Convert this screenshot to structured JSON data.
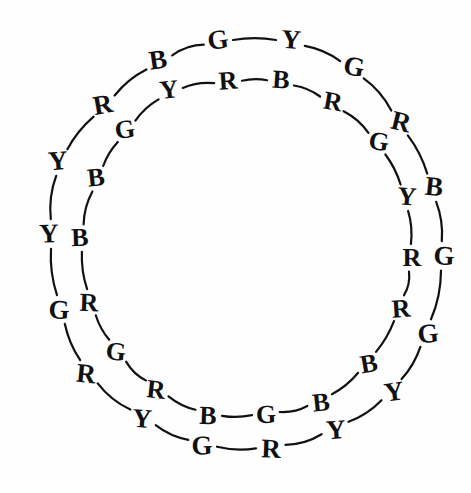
{
  "figure": {
    "background_color": "#fefefe",
    "ink_color": "#111111",
    "width": 471,
    "height": 493,
    "center": {
      "x": 240,
      "y": 243
    }
  },
  "legend": {
    "letters": [
      "R",
      "G",
      "B",
      "Y"
    ],
    "letter_names": {
      "R": "red",
      "G": "green",
      "B": "blue",
      "Y": "yellow"
    }
  },
  "chart_data": {
    "type": "scatter",
    "xlabel": "",
    "ylabel": "",
    "grid": false,
    "legend_position": "none",
    "xlim": [
      0,
      471
    ],
    "ylim": [
      0,
      493
    ],
    "series": [
      {
        "name": "outer-ring",
        "count": 18,
        "radius": 205,
        "labels": [
          "G",
          "Y",
          "G",
          "R",
          "B",
          "G",
          "G",
          "Y",
          "Y",
          "R",
          "G",
          "Y",
          "Y",
          "R",
          "B",
          "G",
          "B",
          "R"
        ],
        "points": [
          {
            "label": "G",
            "x": 218,
            "y": 40
          },
          {
            "label": "Y",
            "x": 291,
            "y": 40
          },
          {
            "label": "G",
            "x": 354,
            "y": 67
          },
          {
            "label": "R",
            "x": 401,
            "y": 122
          },
          {
            "label": "B",
            "x": 434,
            "y": 187
          },
          {
            "label": "G",
            "x": 444,
            "y": 256
          },
          {
            "label": "G",
            "x": 428,
            "y": 334
          },
          {
            "label": "Y",
            "x": 394,
            "y": 392
          },
          {
            "label": "Y",
            "x": 336,
            "y": 430
          },
          {
            "label": "R",
            "x": 271,
            "y": 449
          },
          {
            "label": "G",
            "x": 202,
            "y": 446
          },
          {
            "label": "Y",
            "x": 142,
            "y": 419
          },
          {
            "label": "Y",
            "x": 86,
            "y": 374
          },
          {
            "label": "R",
            "x": 59,
            "y": 310
          },
          {
            "label": "B",
            "x": 79,
            "y": 237
          },
          {
            "label": "G",
            "x": 49,
            "y": 234
          },
          {
            "label": "B",
            "x": 58,
            "y": 161
          },
          {
            "label": "R",
            "x": 103,
            "y": 105
          }
        ]
      },
      {
        "name": "inner-ring",
        "count": 18,
        "radius": 163,
        "labels": [
          "R",
          "B",
          "R",
          "G",
          "Y",
          "R",
          "R",
          "B",
          "B",
          "G",
          "B",
          "Y",
          "R",
          "G",
          "R",
          "B",
          "B",
          "G",
          "Y"
        ],
        "points": [
          {
            "label": "R",
            "x": 228,
            "y": 81
          },
          {
            "label": "B",
            "x": 281,
            "y": 80
          },
          {
            "label": "R",
            "x": 333,
            "y": 102
          },
          {
            "label": "G",
            "x": 379,
            "y": 142
          },
          {
            "label": "Y",
            "x": 407,
            "y": 197
          },
          {
            "label": "R",
            "x": 412,
            "y": 258
          },
          {
            "label": "R",
            "x": 401,
            "y": 309
          },
          {
            "label": "B",
            "x": 369,
            "y": 364
          },
          {
            "label": "B",
            "x": 321,
            "y": 403
          },
          {
            "label": "G",
            "x": 266,
            "y": 415
          },
          {
            "label": "B",
            "x": 208,
            "y": 416
          },
          {
            "label": "Y",
            "x": 156,
            "y": 390
          },
          {
            "label": "R",
            "x": 116,
            "y": 352
          },
          {
            "label": "G",
            "x": 89,
            "y": 303
          },
          {
            "label": "R",
            "x": 80,
            "y": 238
          },
          {
            "label": "B",
            "x": 96,
            "y": 178
          },
          {
            "label": "G",
            "x": 125,
            "y": 130
          },
          {
            "label": "Y",
            "x": 169,
            "y": 90
          }
        ]
      }
    ]
  },
  "outer_ring": {
    "name": "outer-ring",
    "letters": [
      {
        "char": "G",
        "x": 218,
        "y": 40,
        "rot": -8
      },
      {
        "char": "Y",
        "x": 291,
        "y": 40,
        "rot": 4
      },
      {
        "char": "G",
        "x": 354,
        "y": 67,
        "rot": 10
      },
      {
        "char": "R",
        "x": 401,
        "y": 122,
        "rot": 14
      },
      {
        "char": "B",
        "x": 434,
        "y": 187,
        "rot": 6
      },
      {
        "char": "G",
        "x": 444,
        "y": 256,
        "rot": 2
      },
      {
        "char": "G",
        "x": 428,
        "y": 334,
        "rot": -6
      },
      {
        "char": "Y",
        "x": 394,
        "y": 392,
        "rot": -8
      },
      {
        "char": "Y",
        "x": 336,
        "y": 430,
        "rot": -4
      },
      {
        "char": "R",
        "x": 271,
        "y": 449,
        "rot": 2
      },
      {
        "char": "G",
        "x": 202,
        "y": 446,
        "rot": -2
      },
      {
        "char": "Y",
        "x": 142,
        "y": 419,
        "rot": 4
      },
      {
        "char": "R",
        "x": 86,
        "y": 374,
        "rot": 6
      },
      {
        "char": "G",
        "x": 59,
        "y": 310,
        "rot": 2
      },
      {
        "char": "Y",
        "x": 49,
        "y": 234,
        "rot": -2
      },
      {
        "char": "Y",
        "x": 58,
        "y": 161,
        "rot": -4
      },
      {
        "char": "R",
        "x": 103,
        "y": 105,
        "rot": -10
      },
      {
        "char": "B",
        "x": 158,
        "y": 60,
        "rot": -8
      }
    ]
  },
  "inner_ring": {
    "name": "inner-ring",
    "letters": [
      {
        "char": "R",
        "x": 228,
        "y": 81,
        "rot": -4
      },
      {
        "char": "B",
        "x": 281,
        "y": 80,
        "rot": 4
      },
      {
        "char": "R",
        "x": 333,
        "y": 102,
        "rot": 10
      },
      {
        "char": "G",
        "x": 379,
        "y": 142,
        "rot": 8
      },
      {
        "char": "Y",
        "x": 407,
        "y": 197,
        "rot": 4
      },
      {
        "char": "R",
        "x": 412,
        "y": 258,
        "rot": 0
      },
      {
        "char": "R",
        "x": 401,
        "y": 309,
        "rot": -4
      },
      {
        "char": "B",
        "x": 369,
        "y": 364,
        "rot": -10
      },
      {
        "char": "B",
        "x": 321,
        "y": 403,
        "rot": -6
      },
      {
        "char": "G",
        "x": 266,
        "y": 415,
        "rot": -2
      },
      {
        "char": "B",
        "x": 208,
        "y": 416,
        "rot": 2
      },
      {
        "char": "R",
        "x": 156,
        "y": 390,
        "rot": 6
      },
      {
        "char": "G",
        "x": 116,
        "y": 352,
        "rot": 6
      },
      {
        "char": "R",
        "x": 89,
        "y": 303,
        "rot": 2
      },
      {
        "char": "B",
        "x": 80,
        "y": 238,
        "rot": -2
      },
      {
        "char": "B",
        "x": 96,
        "y": 178,
        "rot": -6
      },
      {
        "char": "G",
        "x": 125,
        "y": 130,
        "rot": -8
      },
      {
        "char": "Y",
        "x": 169,
        "y": 90,
        "rot": -6
      }
    ]
  }
}
